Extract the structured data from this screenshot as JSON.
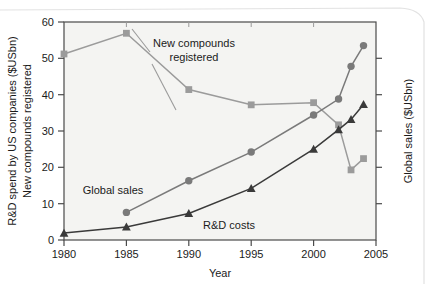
{
  "figure": {
    "background_color": "#ffffff",
    "plot_background_color": "#f4f4f2",
    "frame_color": "#4a4a4a",
    "text_color": "#1b1b1b"
  },
  "axes": {
    "left_title_line1": "R&D spend by US companies ($USbn)",
    "left_title_line2": "New compounds registered",
    "right_title": "Global sales ($USbn)",
    "x_title": "Year",
    "y_ticks": [
      "0",
      "10",
      "20",
      "30",
      "40",
      "50",
      "60"
    ],
    "x_ticks": [
      "1980",
      "1985",
      "1990",
      "1995",
      "2000",
      "2005"
    ]
  },
  "annotations": {
    "new_compounds_line1": "New compounds",
    "new_compounds_line2": "registered",
    "global_sales": "Global sales",
    "rd_costs": "R&D costs"
  },
  "chart_data": {
    "type": "line",
    "title": "",
    "xlabel": "Year",
    "ylabel": "R&D spend by US companies ($USbn) / New compounds registered",
    "y2label": "Global sales ($USbn)",
    "xlim": [
      1980,
      2005
    ],
    "ylim": [
      0,
      60
    ],
    "grid": false,
    "legend": "inline-annotations",
    "series": [
      {
        "name": "New compounds registered",
        "color": "#9b9b9b",
        "marker": "square",
        "x": [
          1980,
          1985,
          1990,
          1995,
          2000,
          2002,
          2003,
          2004
        ],
        "values": [
          51.2,
          56.9,
          41.4,
          37.2,
          37.8,
          31.7,
          19.3,
          22.4
        ]
      },
      {
        "name": "Global sales",
        "color": "#7a7a7a",
        "marker": "circle",
        "x": [
          1985,
          1990,
          1995,
          2000,
          2002,
          2003,
          2004
        ],
        "values": [
          7.6,
          16.3,
          24.2,
          34.4,
          38.8,
          47.8,
          53.5
        ]
      },
      {
        "name": "R&D costs",
        "color": "#3a3a3a",
        "marker": "triangle",
        "x": [
          1980,
          1985,
          1990,
          1995,
          2000,
          2002,
          2003,
          2004
        ],
        "values": [
          1.9,
          3.6,
          7.3,
          14.2,
          25.0,
          30.4,
          33.2,
          37.3
        ]
      }
    ]
  }
}
